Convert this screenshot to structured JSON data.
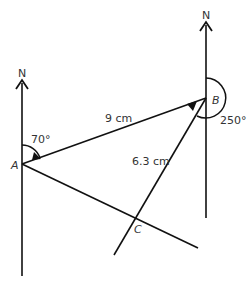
{
  "diagram": {
    "type": "bearing-diagram",
    "points": {
      "A": {
        "label": "A"
      },
      "B": {
        "label": "B"
      },
      "C": {
        "label": "C"
      }
    },
    "north_labels": {
      "A": "N",
      "B": "N"
    },
    "lengths": {
      "AB": "9 cm",
      "BC": "6.3 cm"
    },
    "angles": {
      "A_bearing": "70°",
      "B_bearing": "250°"
    },
    "colors": {
      "line": "#111111",
      "text": "#333333"
    }
  }
}
